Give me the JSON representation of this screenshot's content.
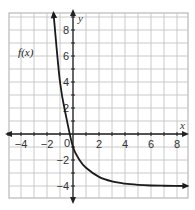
{
  "chart_data": {
    "type": "line",
    "title": "",
    "xlabel": "x",
    "ylabel": "y",
    "xlim": [
      -5,
      8.8
    ],
    "ylim": [
      -4.9,
      9.3
    ],
    "grid": true,
    "grid_step": 1,
    "x_ticks": [
      -4,
      -2,
      0,
      2,
      4,
      6,
      8
    ],
    "y_ticks": [
      -4,
      -2,
      2,
      4,
      6,
      8
    ],
    "x_tick_labels": [
      "−4",
      "−2",
      "0",
      "2",
      "4",
      "6",
      "8"
    ],
    "y_tick_labels": [
      "−4",
      "−2",
      "2",
      "4",
      "6",
      "8"
    ],
    "origin_label": "0",
    "series": [
      {
        "name": "f(x)",
        "label": "f(x)",
        "label_position": [
          -3.3,
          6.3
        ],
        "asymptote": -4,
        "formula_estimate": "f(x) = 4.5^(-x) ... approx 5*(0.5)^(x)... reads as exponential decay to y=-4",
        "points": [
          {
            "x": -1.5,
            "y": 9.3
          },
          {
            "x": -1.0,
            "y": 4.0
          },
          {
            "x": -0.5,
            "y": 1.2
          },
          {
            "x": 0.0,
            "y": -1.0
          },
          {
            "x": 0.5,
            "y": -2.0
          },
          {
            "x": 1.0,
            "y": -2.6
          },
          {
            "x": 2.0,
            "y": -3.3
          },
          {
            "x": 3.0,
            "y": -3.65
          },
          {
            "x": 4.0,
            "y": -3.82
          },
          {
            "x": 5.0,
            "y": -3.91
          },
          {
            "x": 6.0,
            "y": -3.96
          },
          {
            "x": 7.0,
            "y": -3.98
          },
          {
            "x": 8.8,
            "y": -4.0
          }
        ]
      }
    ]
  },
  "labels": {
    "x_axis": "x",
    "y_axis": "y",
    "function": "f(x)"
  }
}
